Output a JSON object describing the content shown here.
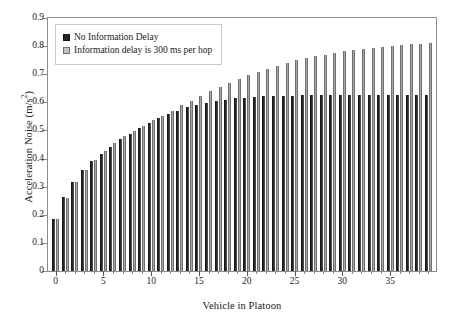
{
  "chart_data": {
    "type": "bar",
    "title": "",
    "xlabel": "Vehicle in Platoon",
    "ylabel": "Acceleration Noise (m/s²)",
    "ylabel_text": "Acceleration Noise (m/s",
    "ylabel_sup": "2",
    "ylabel_tail": ")",
    "xlim": [
      -0.8,
      39.8
    ],
    "ylim": [
      0,
      0.9
    ],
    "grid": false,
    "legend_position": "top-left",
    "ytick_labels": [
      "0",
      "0.1",
      "0.2",
      "0.3",
      "0.4",
      "0.5",
      "0.6",
      "0.7",
      "0.8",
      "0.9"
    ],
    "ytick_values": [
      0,
      0.1,
      0.2,
      0.3,
      0.4,
      0.5,
      0.6,
      0.7,
      0.8,
      0.9
    ],
    "xtick_labels": [
      "0",
      "5",
      "10",
      "15",
      "20",
      "25",
      "30",
      "35"
    ],
    "xtick_values": [
      0,
      5,
      10,
      15,
      20,
      25,
      30,
      35
    ],
    "categories": [
      0,
      1,
      2,
      3,
      4,
      5,
      6,
      7,
      8,
      9,
      10,
      11,
      12,
      13,
      14,
      15,
      16,
      17,
      18,
      19,
      20,
      21,
      22,
      23,
      24,
      25,
      26,
      27,
      28,
      29,
      30,
      31,
      32,
      33,
      34,
      35,
      36,
      37,
      38,
      39
    ],
    "series": [
      {
        "name": "No Information Delay",
        "color": "#262626",
        "values": [
          0.186,
          0.263,
          0.318,
          0.36,
          0.39,
          0.416,
          0.44,
          0.468,
          0.489,
          0.508,
          0.525,
          0.543,
          0.557,
          0.57,
          0.582,
          0.591,
          0.599,
          0.605,
          0.61,
          0.614,
          0.617,
          0.62,
          0.622,
          0.623,
          0.624,
          0.624,
          0.625,
          0.625,
          0.625,
          0.625,
          0.626,
          0.626,
          0.626,
          0.626,
          0.626,
          0.626,
          0.626,
          0.626,
          0.626,
          0.626
        ]
      },
      {
        "name": "Information delay is 300 ms per hop",
        "color": "#a8a8a8",
        "values": [
          0.186,
          0.258,
          0.318,
          0.36,
          0.395,
          0.428,
          0.456,
          0.482,
          0.497,
          0.517,
          0.536,
          0.553,
          0.569,
          0.59,
          0.606,
          0.624,
          0.641,
          0.655,
          0.67,
          0.683,
          0.696,
          0.708,
          0.718,
          0.729,
          0.739,
          0.749,
          0.757,
          0.764,
          0.77,
          0.776,
          0.782,
          0.787,
          0.791,
          0.795,
          0.798,
          0.802,
          0.805,
          0.807,
          0.809,
          0.811
        ]
      }
    ]
  },
  "legend": {
    "items": [
      {
        "label": "No Information Delay",
        "swatch": "dark"
      },
      {
        "label": "Information delay is 300 ms per hop",
        "swatch": "light"
      }
    ]
  }
}
